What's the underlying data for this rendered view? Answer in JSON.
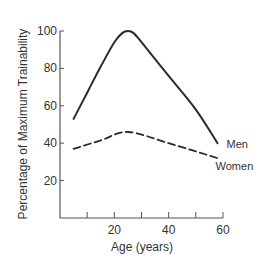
{
  "chart_data": {
    "type": "line",
    "title": "",
    "xlabel": "Age (years)",
    "ylabel": "Percentage of Maximum Trainability",
    "xlim": [
      0,
      60
    ],
    "ylim": [
      0,
      100
    ],
    "x_ticks": [
      10,
      20,
      30,
      40,
      50,
      60
    ],
    "x_tick_labels": [
      "",
      "20",
      "",
      "40",
      "",
      "60"
    ],
    "y_ticks": [
      20,
      40,
      60,
      80,
      100
    ],
    "y_tick_labels": [
      "20",
      "40",
      "60",
      "80",
      "100"
    ],
    "grid": false,
    "legend": "inline labels at line ends",
    "series": [
      {
        "name": "Men",
        "style": "solid",
        "x": [
          5,
          10,
          15,
          20,
          23,
          25,
          27,
          30,
          40,
          50,
          58
        ],
        "y": [
          53,
          67,
          81,
          94,
          99,
          100,
          99,
          94,
          76,
          58,
          40
        ]
      },
      {
        "name": "Women",
        "style": "dashed",
        "x": [
          5,
          15,
          25,
          40,
          58
        ],
        "y": [
          37,
          41.5,
          46,
          40,
          32
        ]
      }
    ]
  }
}
